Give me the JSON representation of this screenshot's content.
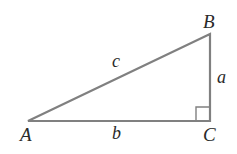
{
  "diagram": {
    "type": "right-triangle",
    "vertices": {
      "A": {
        "label": "A",
        "x": 28,
        "y": 121
      },
      "B": {
        "label": "B",
        "x": 210,
        "y": 34
      },
      "C": {
        "label": "C",
        "x": 210,
        "y": 121
      }
    },
    "sides": {
      "a": {
        "label": "a",
        "between": [
          "B",
          "C"
        ]
      },
      "b": {
        "label": "b",
        "between": [
          "A",
          "C"
        ]
      },
      "c": {
        "label": "c",
        "between": [
          "A",
          "B"
        ]
      }
    },
    "right_angle_at": "C",
    "colors": {
      "stroke": "#808080",
      "text": "#2a2a2a",
      "background": "#ffffff"
    }
  }
}
